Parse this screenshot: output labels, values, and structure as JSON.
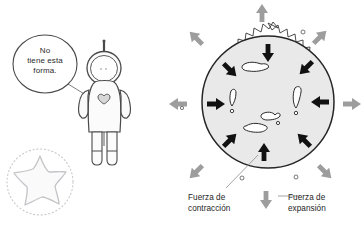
{
  "illustration": {
    "title": "Fuerzas de contraccion y expansion en una estrella",
    "language": "es",
    "background_color": "#ffffff"
  },
  "speech_bubble": {
    "name": "speech-bubble",
    "lines": [
      "No",
      "tiene esta",
      "forma."
    ],
    "full_text": "No tiene esta forma.",
    "stroke_color": "#3a3a3a",
    "fill_color": "#ffffff"
  },
  "character": {
    "name": "astronaut-figure",
    "description": "astronauta con casco redondo y antena",
    "stroke_color": "#4a4a4a",
    "fill_color": "#fbfbfb"
  },
  "star_shape": {
    "name": "faint-star-shape",
    "description": "estrella de cinco puntas tenue con circulo punteado",
    "stroke_color": "#c9c9cc",
    "fill_color": "#fafafa",
    "points": 5
  },
  "star_diagram": {
    "name": "star-forces-diagram",
    "body_fill": "#e9e9e9",
    "body_stroke": "#2a2a2a",
    "corona_stroke": "#3a3a3a",
    "inward_arrow_color": "#111111",
    "outward_arrow_color": "#9a9a9a",
    "inward_arrow_count": 8,
    "outward_arrow_count": 8,
    "blob_count": 5,
    "blob_fill": "#ffffff",
    "blob_stroke": "#2a2a2a"
  },
  "labels": {
    "contraction": {
      "name": "label-contraction",
      "lines": [
        "Fuerza de",
        "contracción"
      ],
      "full_text": "Fuerza de contracción",
      "color": "#1d1d1d"
    },
    "expansion": {
      "name": "label-expansion",
      "lines": [
        "Fuerza de",
        "expansión"
      ],
      "full_text": "Fuerza de expansión",
      "color": "#1d1d1d"
    }
  },
  "leader_lines": {
    "name": "leader-lines",
    "color": "#8d8d8d",
    "count": 2
  }
}
